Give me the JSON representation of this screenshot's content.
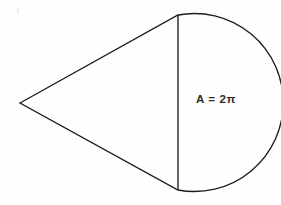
{
  "figure": {
    "background_color": "#fefefe",
    "stroke_color": "#1d1d1d",
    "label_color": "#2a2a2a",
    "width": 281,
    "height": 205,
    "artifact": {
      "glyph": "⸮",
      "color": "#d8d8d8",
      "x": 16,
      "y": 9
    },
    "label": {
      "text": "A = 2π",
      "x": 196,
      "y": 94
    },
    "geometry": {
      "apex": {
        "x": 20,
        "y": 103
      },
      "chord_top": {
        "x": 178,
        "y": 15
      },
      "chord_bottom": {
        "x": 178,
        "y": 190
      },
      "arc_rightmost_x": 267,
      "arc_radius": 89,
      "outline_path": "M 20 103 L 178 15 A 89 89 0 1 1 178 190 Z",
      "chord_path": "M 178 15 L 178 190"
    }
  },
  "chart_data": {
    "type": "diagram",
    "annotations": [
      "A = 2π"
    ],
    "shapes": [
      {
        "name": "triangle",
        "vertices": [
          [
            20,
            103
          ],
          [
            178,
            15
          ],
          [
            178,
            190
          ]
        ]
      },
      {
        "name": "semicircle",
        "diameter_endpoints": [
          [
            178,
            15
          ],
          [
            178,
            190
          ]
        ],
        "bulge_direction": "right",
        "rightmost_x": 267,
        "radius": 89
      },
      {
        "name": "chord",
        "endpoints": [
          [
            178,
            15
          ],
          [
            178,
            190
          ]
        ]
      }
    ]
  }
}
